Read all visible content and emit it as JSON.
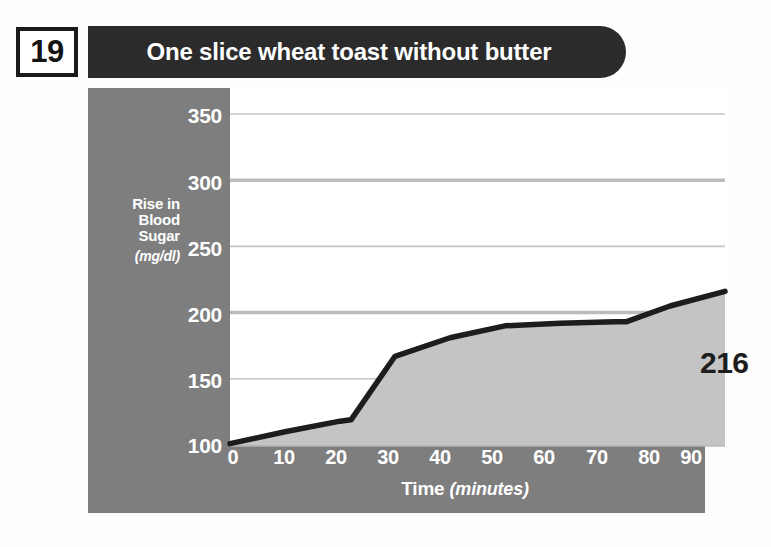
{
  "header": {
    "number": "19",
    "title": "One slice wheat toast without butter"
  },
  "colors": {
    "panel_gray": "#7e7e7e",
    "header_dark": "#2b2b2b",
    "area_fill": "#c4c4c4",
    "line": "#1d1d1d",
    "gridline": "#b9b9b9",
    "plot_bg": "#ffffff",
    "tick_text": "#ffffff"
  },
  "chart_data": {
    "type": "area",
    "title": "One slice wheat toast without butter",
    "xlabel": "Time",
    "xlabel_unit": "(minutes)",
    "ylabel": "Rise in Blood Sugar",
    "ylabel_unit": "(mg/dl)",
    "xticks": [
      "0",
      "10",
      "20",
      "30",
      "40",
      "50",
      "60",
      "70",
      "80",
      "90"
    ],
    "yticks": [
      "100",
      "150",
      "200",
      "250",
      "300",
      "350"
    ],
    "xlim": [
      0,
      90
    ],
    "ylim": [
      100,
      350
    ],
    "grid": true,
    "legend": "none",
    "x": [
      0,
      10,
      20,
      22,
      30,
      40,
      50,
      60,
      70,
      72,
      80,
      90
    ],
    "values": [
      101,
      110,
      118,
      119,
      167,
      181,
      190,
      192,
      193,
      193,
      205,
      216
    ],
    "final_value_label": "216",
    "annotations": [
      {
        "text": "216",
        "x": 90,
        "y": 216
      }
    ]
  }
}
